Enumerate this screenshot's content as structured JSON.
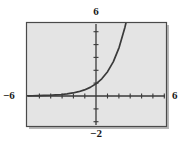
{
  "figure": {
    "type": "graph-plot",
    "background_color": "#ffffff",
    "plot_background_color": "#e4e4e4",
    "frame_border_color": "#4a4a4a",
    "axis_color": "#3a3a3a",
    "curve_color": "#3a3a3a"
  },
  "labels": {
    "top": "6",
    "bottom": "−2",
    "left": "−6",
    "right": "6"
  },
  "chart_data": {
    "type": "line",
    "title": "",
    "xlabel": "",
    "ylabel": "",
    "xlim": [
      -6,
      6
    ],
    "ylim": [
      -2,
      6
    ],
    "grid": false,
    "legend": null,
    "axis_tick_labels": {
      "x": [
        "−6",
        "6"
      ],
      "y": [
        "−2",
        "6"
      ]
    },
    "x_tick_interval": 1,
    "y_tick_interval": 1,
    "series": [
      {
        "name": "exponential growth curve",
        "equation": "y = 2^x",
        "x": [
          -6,
          -5.5,
          -5,
          -4.5,
          -4,
          -3.5,
          -3,
          -2.5,
          -2,
          -1.5,
          -1,
          -0.5,
          0,
          0.5,
          1,
          1.5,
          2,
          2.5,
          2.585
        ],
        "y": [
          0.0156,
          0.0221,
          0.0313,
          0.0442,
          0.0625,
          0.0884,
          0.125,
          0.1768,
          0.25,
          0.3536,
          0.5,
          0.7071,
          1.0,
          1.4142,
          2.0,
          2.8284,
          4.0,
          5.6569,
          6.0
        ]
      }
    ],
    "annotations": [
      {
        "text": "horizontal asymptote at y = 0",
        "visible": false
      }
    ]
  }
}
